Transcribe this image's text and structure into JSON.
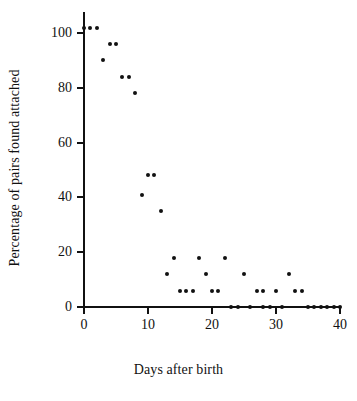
{
  "chart_data": {
    "type": "scatter",
    "title": "",
    "xlabel": "Days after birth",
    "ylabel": "Percentage of pairs found attached",
    "xlim": [
      0,
      40
    ],
    "ylim": [
      0,
      105
    ],
    "xticks": [
      0,
      10,
      20,
      30,
      40
    ],
    "yticks": [
      0,
      20,
      40,
      60,
      80,
      100
    ],
    "xtick_labels": [
      "0",
      "10",
      "20",
      "30",
      "40"
    ],
    "ytick_labels": [
      "0",
      "20",
      "40",
      "60",
      "80",
      "100"
    ],
    "grid": false,
    "legend": null,
    "marker": "filled-circle",
    "marker_color": "#111111",
    "series": [
      {
        "name": "pairs attached",
        "points": [
          [
            0,
            102
          ],
          [
            1,
            102
          ],
          [
            2,
            102
          ],
          [
            3,
            90
          ],
          [
            4,
            96
          ],
          [
            5,
            96
          ],
          [
            6,
            84
          ],
          [
            7,
            84
          ],
          [
            8,
            78
          ],
          [
            9,
            41
          ],
          [
            10,
            48
          ],
          [
            11,
            48
          ],
          [
            12,
            35
          ],
          [
            13,
            12
          ],
          [
            14,
            18
          ],
          [
            15,
            6
          ],
          [
            16,
            6
          ],
          [
            17,
            6
          ],
          [
            18,
            18
          ],
          [
            19,
            12
          ],
          [
            20,
            6
          ],
          [
            21,
            6
          ],
          [
            22,
            18
          ],
          [
            23,
            0
          ],
          [
            24,
            0
          ],
          [
            25,
            12
          ],
          [
            26,
            0
          ],
          [
            27,
            6
          ],
          [
            28,
            6
          ],
          [
            28,
            0
          ],
          [
            29,
            0
          ],
          [
            30,
            6
          ],
          [
            31,
            0
          ],
          [
            32,
            12
          ],
          [
            33,
            6
          ],
          [
            34,
            6
          ],
          [
            35,
            0
          ],
          [
            36,
            0
          ],
          [
            37,
            0
          ],
          [
            38,
            0
          ],
          [
            39,
            0
          ],
          [
            40,
            0
          ]
        ]
      }
    ]
  },
  "axis": {
    "ylabel_text": "Percentage of pairs found attached",
    "xlabel_text": "Days after birth"
  }
}
